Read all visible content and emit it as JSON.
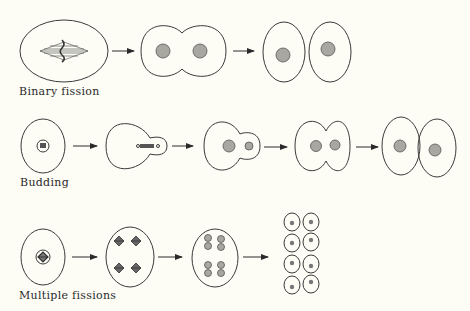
{
  "rows": [
    {
      "label": "Binary fission"
    },
    {
      "label": "Budding"
    },
    {
      "label": "Multiple fissions"
    }
  ],
  "colors": {
    "background": "#fdfdf6",
    "line": "#3a3a3a",
    "nucleus": "#a8a8a0"
  }
}
